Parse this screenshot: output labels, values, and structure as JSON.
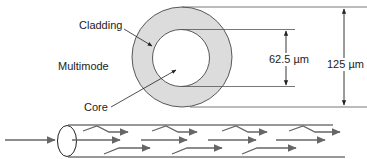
{
  "diagram": {
    "title": "Multimode",
    "labels": {
      "cladding": "Cladding",
      "core": "Core",
      "mode": "Multimode"
    },
    "dimensions": {
      "core_diameter": "62.5 µm",
      "cladding_diameter": "125 µm"
    },
    "colors": {
      "cladding_fill": "#dcdcdc",
      "core_fill": "#ffffff",
      "stroke": "#333333",
      "ray": "#666666"
    }
  }
}
